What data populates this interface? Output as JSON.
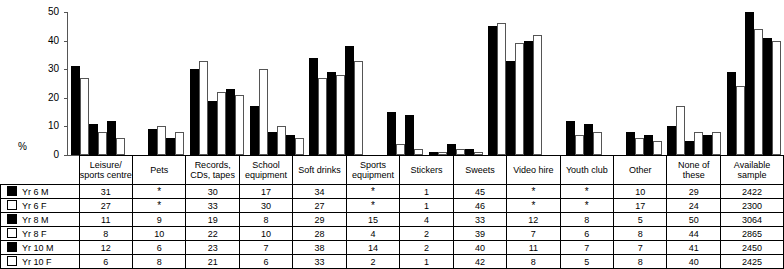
{
  "chart_data": {
    "type": "bar",
    "title": "",
    "xlabel": "",
    "ylabel": "%",
    "ylim": [
      0,
      50
    ],
    "yticks": [
      0,
      10,
      20,
      30,
      40,
      50
    ],
    "grid": false,
    "legend_position": "table-row-headers",
    "categories": [
      "Leisure/ sports centre",
      "Pets",
      "Records, CDs, tapes",
      "School equipment",
      "Soft drinks",
      "Sports equipment",
      "Stickers",
      "Sweets",
      "Video hire",
      "Youth club",
      "Other",
      "None of these"
    ],
    "missing_marker": "*",
    "series": [
      {
        "name": "Yr 6 M",
        "marker": "filled",
        "values": [
          31,
          null,
          30,
          17,
          34,
          null,
          1,
          45,
          null,
          null,
          10,
          29
        ],
        "available_sample": 2422
      },
      {
        "name": "Yr 6 F",
        "marker": "hollow",
        "values": [
          27,
          null,
          33,
          30,
          27,
          null,
          1,
          46,
          null,
          null,
          17,
          24
        ],
        "available_sample": 2300
      },
      {
        "name": "Yr 8 M",
        "marker": "filled",
        "values": [
          11,
          9,
          19,
          8,
          29,
          15,
          4,
          33,
          12,
          8,
          5,
          50
        ],
        "available_sample": 3064
      },
      {
        "name": "Yr 8 F",
        "marker": "hollow",
        "values": [
          8,
          10,
          22,
          10,
          28,
          4,
          2,
          39,
          7,
          6,
          8,
          44
        ],
        "available_sample": 2865
      },
      {
        "name": "Yr 10 M",
        "marker": "filled",
        "values": [
          12,
          6,
          23,
          7,
          38,
          14,
          2,
          40,
          11,
          7,
          7,
          41
        ],
        "available_sample": 2450
      },
      {
        "name": "Yr 10 F",
        "marker": "hollow",
        "values": [
          6,
          8,
          21,
          6,
          33,
          2,
          1,
          42,
          8,
          5,
          8,
          40
        ],
        "available_sample": 2425
      }
    ]
  },
  "table": {
    "header_categories": [
      [
        "Leisure/",
        "sports centre"
      ],
      [
        "Pets",
        ""
      ],
      [
        "Records,",
        "CDs, tapes"
      ],
      [
        "School",
        "equipment"
      ],
      [
        "Soft drinks",
        ""
      ],
      [
        "Sports",
        "equipment"
      ],
      [
        "Stickers",
        ""
      ],
      [
        "Sweets",
        ""
      ],
      [
        "Video hire",
        ""
      ],
      [
        "Youth club",
        ""
      ],
      [
        "Other",
        ""
      ],
      [
        "None of these",
        ""
      ]
    ],
    "sample_header": [
      "Available",
      "sample"
    ],
    "rows": [
      {
        "label": "Yr 6 M",
        "marker": "filled",
        "cells": [
          "31",
          "*",
          "30",
          "17",
          "34",
          "*",
          "1",
          "45",
          "*",
          "*",
          "10",
          "29"
        ],
        "sample": "2422"
      },
      {
        "label": "Yr 6 F",
        "marker": "hollow",
        "cells": [
          "27",
          "*",
          "33",
          "30",
          "27",
          "*",
          "1",
          "46",
          "*",
          "*",
          "17",
          "24"
        ],
        "sample": "2300"
      },
      {
        "label": "Yr 8 M",
        "marker": "filled",
        "cells": [
          "11",
          "9",
          "19",
          "8",
          "29",
          "15",
          "4",
          "33",
          "12",
          "8",
          "5",
          "50"
        ],
        "sample": "3064"
      },
      {
        "label": "Yr 8 F",
        "marker": "hollow",
        "cells": [
          "8",
          "10",
          "22",
          "10",
          "28",
          "4",
          "2",
          "39",
          "7",
          "6",
          "8",
          "44"
        ],
        "sample": "2865"
      },
      {
        "label": "Yr 10 M",
        "marker": "filled",
        "cells": [
          "12",
          "6",
          "23",
          "7",
          "38",
          "14",
          "2",
          "40",
          "11",
          "7",
          "7",
          "41"
        ],
        "sample": "2450"
      },
      {
        "label": "Yr 10 F",
        "marker": "hollow",
        "cells": [
          "6",
          "8",
          "21",
          "6",
          "33",
          "2",
          "1",
          "42",
          "8",
          "5",
          "8",
          "40"
        ],
        "sample": "2425"
      }
    ]
  },
  "colors": {
    "male_bar": "#000000",
    "female_bar": "#ffffff",
    "outline": "#555555",
    "border": "#000000"
  }
}
